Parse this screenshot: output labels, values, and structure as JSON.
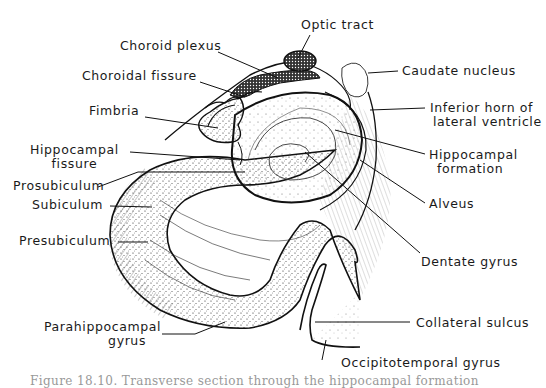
{
  "figure": {
    "type": "anatomical illustration",
    "caption": "Figure 18.10. Transverse section through the hippocampal formation",
    "ink_color": "#1a1a1a",
    "background": "#ffffff"
  },
  "labels": {
    "optic_tract": "Optic tract",
    "choroid_plexus": "Choroid plexus",
    "choroidal_fissure": "Choroidal fissure",
    "caudate_nucleus": "Caudate nucleus",
    "fimbria": "Fimbria",
    "inferior_horn_line1": "Inferior horn of",
    "inferior_horn_line2": "lateral ventricle",
    "hippocampal_fissure_line1": "Hippocampal",
    "hippocampal_fissure_line2": "fissure",
    "hippocampal_formation_line1": "Hippocampal",
    "hippocampal_formation_line2": "formation",
    "prosubiculum": "Prosubiculum",
    "subiculum": "Subiculum",
    "alveus": "Alveus",
    "presubiculum": "Presubiculum",
    "dentate_gyrus": "Dentate gyrus",
    "parahippocampal_line1": "Parahippocampal",
    "parahippocampal_line2": "gyrus",
    "collateral_sulcus": "Collateral sulcus",
    "occipitotemporal_gyrus": "Occipitotemporal gyrus"
  }
}
